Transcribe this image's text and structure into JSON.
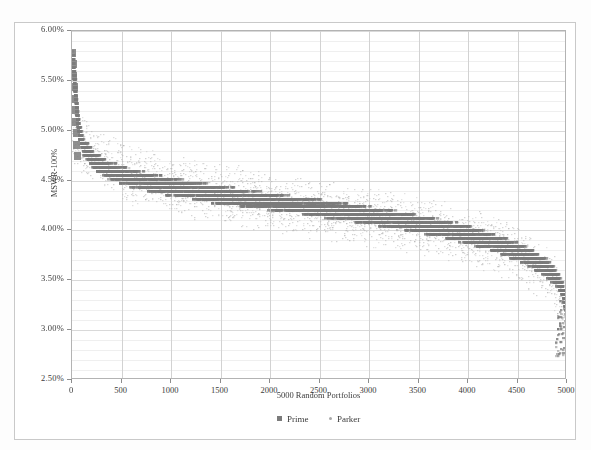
{
  "chart_data": {
    "type": "scatter",
    "title": "",
    "xlabel": "5000 Random Portfolios",
    "ylabel": "MSWR-100%",
    "xlim": [
      0,
      5000
    ],
    "ylim": [
      0.025,
      0.06
    ],
    "x_ticks": [
      0,
      500,
      1000,
      1500,
      2000,
      2500,
      3000,
      3500,
      4000,
      4500,
      5000
    ],
    "x_tick_labels": [
      "0",
      "500",
      "1000",
      "1500",
      "2000",
      "2500",
      "3000",
      "3500",
      "4000",
      "4500",
      "5000"
    ],
    "y_ticks": [
      0.025,
      0.03,
      0.035,
      0.04,
      0.045,
      0.05,
      0.055,
      0.06
    ],
    "y_tick_labels": [
      "2.50%",
      "3.00%",
      "3.50%",
      "4.00%",
      "4.50%",
      "5.00%",
      "5.50%",
      "6.00%"
    ],
    "y_minor_step": 0.001,
    "grid": true,
    "legend_position": "bottom",
    "series": [
      {
        "name": "Prime",
        "color": "#7b7b7b",
        "marker": "square",
        "description": "Dense monotonically decreasing step-ladder of sorted MSWR values across 5000 sorted random portfolios",
        "points_x": [
          5,
          12,
          20,
          28,
          36,
          46,
          58,
          75,
          100,
          140,
          200,
          290,
          420,
          600,
          820,
          1080,
          1380,
          1720,
          2080,
          2450,
          2820,
          3180,
          3520,
          3820,
          4080,
          4300,
          4490,
          4650,
          4780,
          4875,
          4935,
          4970,
          4990,
          4998
        ],
        "points_y": [
          0.0573,
          0.0562,
          0.0551,
          0.054,
          0.0529,
          0.0518,
          0.0507,
          0.0497,
          0.0488,
          0.048,
          0.0473,
          0.0466,
          0.0459,
          0.0453,
          0.0448,
          0.0443,
          0.0438,
          0.0433,
          0.0428,
          0.0423,
          0.0418,
          0.0412,
          0.0406,
          0.04,
          0.0393,
          0.0386,
          0.0379,
          0.0371,
          0.0363,
          0.0354,
          0.0344,
          0.0333,
          0.032,
          0.0305
        ]
      },
      {
        "name": "Parker",
        "color": "#b0b0b0",
        "marker": "dot",
        "description": "Sparse light-gray scatter cloud spread horizontally across the same bands, widening toward low portfolio indices",
        "points_x": [
          30,
          90,
          180,
          310,
          470,
          660,
          880,
          1120,
          1390,
          1680,
          1990,
          2310,
          2640,
          2970,
          3290,
          3600,
          3890,
          4150,
          4380,
          4570,
          4720,
          4840,
          4920,
          4970
        ],
        "points_y": [
          0.0495,
          0.0487,
          0.0479,
          0.047,
          0.0462,
          0.0455,
          0.0449,
          0.0444,
          0.0439,
          0.0434,
          0.0429,
          0.0424,
          0.0419,
          0.0414,
          0.0409,
          0.0403,
          0.0397,
          0.039,
          0.0382,
          0.0373,
          0.0363,
          0.035,
          0.0336,
          0.0318
        ]
      }
    ]
  },
  "axes": {
    "y_title": "MSWR-100%",
    "x_title": "5000 Random Portfolios"
  },
  "legend": {
    "items": [
      {
        "label": "Prime",
        "marker": "square-marker",
        "color": "#7b7b7b"
      },
      {
        "label": "Parker",
        "marker": "dot-marker",
        "color": "#b0b0b0"
      }
    ]
  }
}
